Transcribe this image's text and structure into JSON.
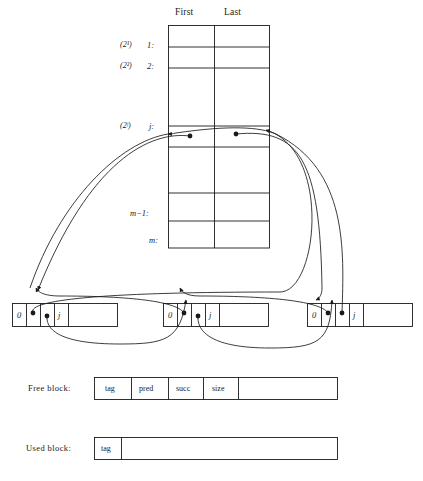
{
  "figure": {
    "stroke_color": "#1a1a1a",
    "background_color": "#ffffff"
  },
  "avail_table": {
    "name": "avail-table",
    "headers": [
      "First",
      "Last"
    ],
    "rows": [
      {
        "power_label": "(2¹)",
        "index_label": "1:",
        "first": "",
        "last": ""
      },
      {
        "power_label": "(2²)",
        "index_label": "2:",
        "first": "",
        "last": ""
      },
      {
        "power_label": "",
        "index_label": "",
        "first": "",
        "last": ""
      },
      {
        "power_label": "(2ʲ)",
        "index_label": "j:",
        "first": "●",
        "last": "●"
      },
      {
        "power_label": "",
        "index_label": "",
        "first": "",
        "last": ""
      },
      {
        "power_label": "",
        "index_label": "m−1:",
        "first": "",
        "last": ""
      },
      {
        "power_label": "",
        "index_label": "m:",
        "first": "",
        "last": ""
      }
    ]
  },
  "blocks": [
    {
      "name": "free-block-left",
      "cells": [
        {
          "field": "tag",
          "value": "0"
        },
        {
          "field": "pred",
          "value": "●"
        },
        {
          "field": "succ",
          "value": "●"
        },
        {
          "field": "size",
          "value": "j"
        },
        {
          "field": "payload",
          "value": ""
        }
      ]
    },
    {
      "name": "free-block-middle",
      "cells": [
        {
          "field": "tag",
          "value": "0"
        },
        {
          "field": "pred",
          "value": "●"
        },
        {
          "field": "succ",
          "value": "●"
        },
        {
          "field": "size",
          "value": "j"
        },
        {
          "field": "payload",
          "value": ""
        }
      ]
    },
    {
      "name": "free-block-right",
      "cells": [
        {
          "field": "tag",
          "value": "0"
        },
        {
          "field": "pred",
          "value": "●"
        },
        {
          "field": "succ",
          "value": "●"
        },
        {
          "field": "size",
          "value": "j"
        },
        {
          "field": "payload",
          "value": ""
        }
      ]
    }
  ],
  "legend": {
    "free_block": {
      "label": "Free block:",
      "cells": [
        "tag",
        "pred",
        "succ",
        "size",
        ""
      ]
    },
    "used_block": {
      "label": "Used block:",
      "cells": [
        "tag",
        ""
      ]
    }
  }
}
